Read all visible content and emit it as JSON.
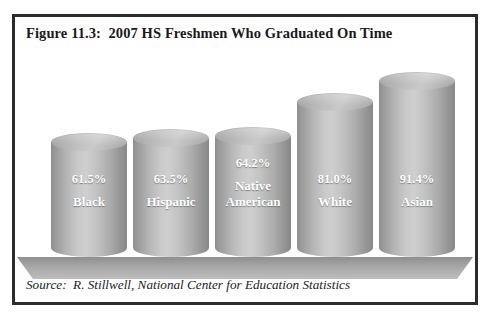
{
  "figure": {
    "title": "Figure 11.3:  2007 HS Freshmen Who Graduated On Time",
    "source": "Source:  R. Stillwell, National Center for Education Statistics",
    "border_color": "#2b2b2b",
    "background_color": "#ffffff"
  },
  "chart_data": {
    "type": "bar",
    "title": "Figure 11.3:  2007 HS Freshmen Who Graduated On Time",
    "subtitle": "",
    "xlabel": "",
    "ylabel": "",
    "ylim": [
      0,
      100
    ],
    "grid": false,
    "legend": "none",
    "value_suffix": "%",
    "bar_style": "3d-cylinder",
    "bar_color": "#bdbdbd",
    "label_color": "#ffffff",
    "categories": [
      "Black",
      "Hispanic",
      "Native American",
      "White",
      "Asian"
    ],
    "values": [
      61.5,
      63.5,
      64.2,
      81.0,
      91.4
    ],
    "value_labels": [
      "61.5%",
      "63.5%",
      "64.2%",
      "81.0%",
      "91.4%"
    ],
    "annotations": [
      "Source:  R. Stillwell, National Center for Education Statistics"
    ]
  },
  "bars": [
    {
      "value_label": "61.5%",
      "name": "Black",
      "left": 36,
      "width": 76,
      "height": 124
    },
    {
      "value_label": "63.5%",
      "name": "Hispanic",
      "left": 118,
      "width": 76,
      "height": 128
    },
    {
      "value_label": "64.2%",
      "name": "Native\nAmerican",
      "left": 200,
      "width": 76,
      "height": 130
    },
    {
      "value_label": "81.0%",
      "name": "White",
      "left": 282,
      "width": 76,
      "height": 164
    },
    {
      "value_label": "91.4%",
      "name": "Asian",
      "left": 364,
      "width": 76,
      "height": 185
    }
  ]
}
